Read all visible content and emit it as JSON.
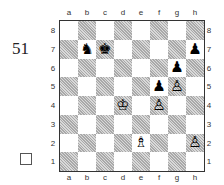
{
  "puzzle": {
    "number": "51",
    "checkbox_checked": false
  },
  "board": {
    "files": [
      "a",
      "b",
      "c",
      "d",
      "e",
      "f",
      "g",
      "h"
    ],
    "ranks": [
      "8",
      "7",
      "6",
      "5",
      "4",
      "3",
      "2",
      "1"
    ],
    "light_square_color": "#ffffff",
    "dark_square_color": "#c8c8c8",
    "pieces": [
      {
        "square": "b7",
        "color": "black",
        "type": "knight",
        "glyph": "♞"
      },
      {
        "square": "c7",
        "color": "black",
        "type": "king",
        "glyph": "♚"
      },
      {
        "square": "h7",
        "color": "black",
        "type": "pawn",
        "glyph": "♟"
      },
      {
        "square": "g6",
        "color": "black",
        "type": "pawn",
        "glyph": "♟"
      },
      {
        "square": "f5",
        "color": "black",
        "type": "pawn",
        "glyph": "♟"
      },
      {
        "square": "g5",
        "color": "white",
        "type": "pawn",
        "glyph": "♙"
      },
      {
        "square": "d4",
        "color": "white",
        "type": "king",
        "glyph": "♔"
      },
      {
        "square": "f4",
        "color": "white",
        "type": "pawn",
        "glyph": "♙"
      },
      {
        "square": "e2",
        "color": "white",
        "type": "bishop",
        "glyph": "♗"
      },
      {
        "square": "h2",
        "color": "white",
        "type": "pawn",
        "glyph": "♙"
      }
    ]
  }
}
